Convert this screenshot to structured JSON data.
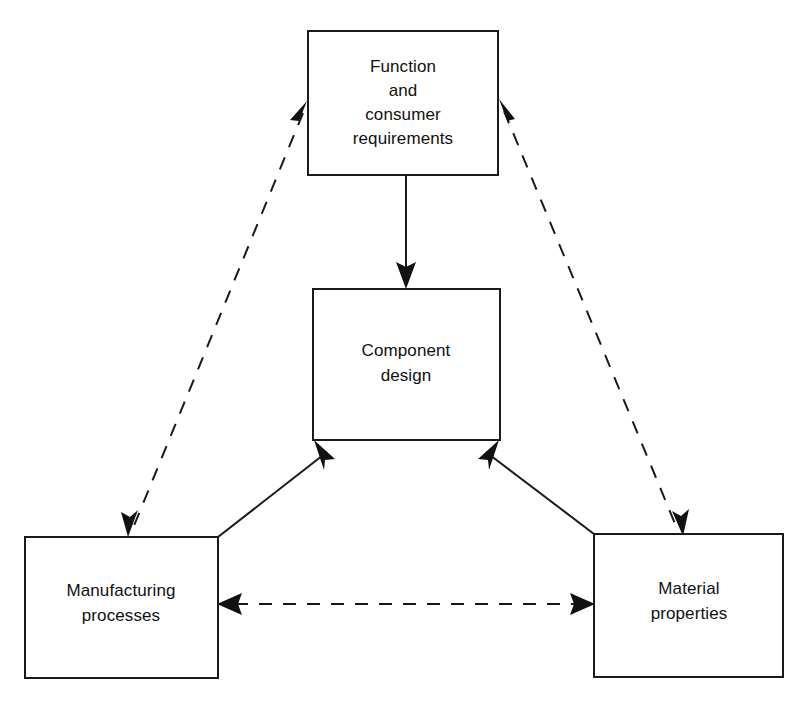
{
  "diagram": {
    "background_color": "#ffffff",
    "line_color": "#1a1a1a",
    "text_color": "#111111",
    "nodes": [
      {
        "id": "function",
        "lines": [
          "Function",
          "and",
          "consumer",
          "requirements"
        ],
        "line1": "Function",
        "line2": "and",
        "line3": "consumer",
        "line4": "requirements"
      },
      {
        "id": "component-design",
        "lines": [
          "Component",
          "design"
        ],
        "line1": "Component",
        "line2": "design"
      },
      {
        "id": "manufacturing",
        "lines": [
          "Manufacturing",
          "processes"
        ],
        "line1": "Manufacturing",
        "line2": "processes"
      },
      {
        "id": "material",
        "lines": [
          "Material",
          "properties"
        ],
        "line1": "Material",
        "line2": "properties"
      }
    ],
    "edges": [
      {
        "id": "function-to-component",
        "from": "function",
        "to": "component-design",
        "style": "solid",
        "arrows": "single"
      },
      {
        "id": "manufacturing-to-component",
        "from": "manufacturing",
        "to": "component-design",
        "style": "solid",
        "arrows": "single"
      },
      {
        "id": "material-to-component",
        "from": "material",
        "to": "component-design",
        "style": "solid",
        "arrows": "single"
      },
      {
        "id": "function-manufacturing",
        "from": "function",
        "to": "manufacturing",
        "style": "dashed",
        "arrows": "double"
      },
      {
        "id": "function-material",
        "from": "function",
        "to": "material",
        "style": "dashed",
        "arrows": "double"
      },
      {
        "id": "manufacturing-material",
        "from": "manufacturing",
        "to": "material",
        "style": "dashed",
        "arrows": "double"
      }
    ]
  }
}
